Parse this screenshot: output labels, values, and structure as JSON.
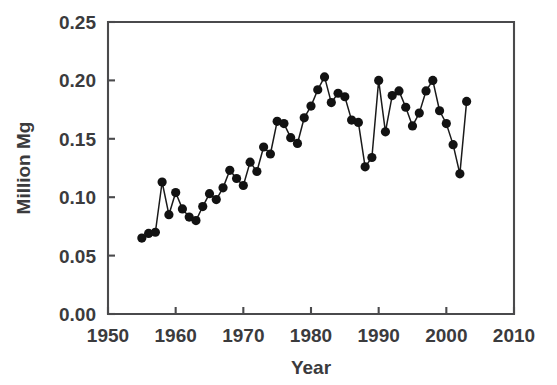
{
  "chart_data": {
    "type": "line",
    "title": "",
    "subtitle": "",
    "xlabel": "Year",
    "ylabel": "Million Mg",
    "xlim": [
      1950,
      2010
    ],
    "ylim": [
      0.0,
      0.25
    ],
    "xticks": [
      1950,
      1960,
      1970,
      1980,
      1990,
      2000,
      2010
    ],
    "xtick_labels": [
      "1950",
      "1960",
      "1970",
      "1980",
      "1990",
      "2000",
      "2010"
    ],
    "yticks": [
      0.0,
      0.05,
      0.1,
      0.15,
      0.2,
      0.25
    ],
    "ytick_labels": [
      "0.00",
      "0.05",
      "0.10",
      "0.15",
      "0.20",
      "0.25"
    ],
    "grid": false,
    "legend": null,
    "legend_position": "none",
    "marker": "filled-circle",
    "line_color": "#1a1a1a",
    "marker_color": "#121212",
    "x": [
      1955,
      1956,
      1957,
      1958,
      1959,
      1960,
      1961,
      1962,
      1963,
      1964,
      1965,
      1966,
      1967,
      1968,
      1969,
      1970,
      1971,
      1972,
      1973,
      1974,
      1975,
      1976,
      1977,
      1978,
      1979,
      1980,
      1981,
      1982,
      1983,
      1984,
      1985,
      1986,
      1987,
      1988,
      1989,
      1990,
      1991,
      1992,
      1993,
      1994,
      1995,
      1996,
      1997,
      1998,
      1999,
      2000,
      2001,
      2002,
      2003
    ],
    "values": [
      0.065,
      0.069,
      0.07,
      0.113,
      0.085,
      0.104,
      0.09,
      0.083,
      0.08,
      0.092,
      0.103,
      0.098,
      0.108,
      0.123,
      0.116,
      0.11,
      0.13,
      0.122,
      0.143,
      0.137,
      0.165,
      0.163,
      0.151,
      0.146,
      0.168,
      0.178,
      0.192,
      0.203,
      0.181,
      0.189,
      0.186,
      0.166,
      0.164,
      0.126,
      0.134,
      0.2,
      0.156,
      0.187,
      0.191,
      0.177,
      0.161,
      0.172,
      0.191,
      0.2,
      0.174,
      0.163,
      0.145,
      0.12,
      0.182
    ],
    "series": [
      {
        "name": "Million Mg",
        "values": [
          0.065,
          0.069,
          0.07,
          0.113,
          0.085,
          0.104,
          0.09,
          0.083,
          0.08,
          0.092,
          0.103,
          0.098,
          0.108,
          0.123,
          0.116,
          0.11,
          0.13,
          0.122,
          0.143,
          0.137,
          0.165,
          0.163,
          0.151,
          0.146,
          0.168,
          0.178,
          0.192,
          0.203,
          0.181,
          0.189,
          0.186,
          0.166,
          0.164,
          0.126,
          0.134,
          0.2,
          0.156,
          0.187,
          0.191,
          0.177,
          0.161,
          0.172,
          0.191,
          0.2,
          0.174,
          0.163,
          0.145,
          0.12,
          0.182
        ]
      }
    ],
    "annotations": []
  },
  "plot_geometry": {
    "left": 108,
    "right": 514,
    "top": 22,
    "bottom": 314
  }
}
